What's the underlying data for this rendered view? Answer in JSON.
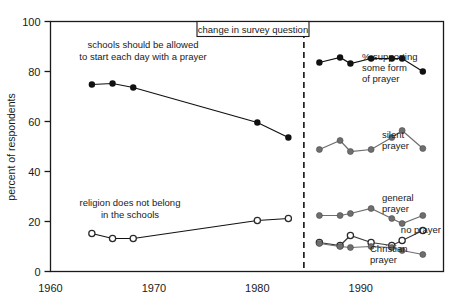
{
  "chart_data": {
    "type": "line",
    "title": "",
    "xlabel": "",
    "ylabel": "percent of respondents",
    "xlim": [
      1960,
      1998
    ],
    "ylim": [
      0,
      100
    ],
    "grid": false,
    "legend_position": "inline-right",
    "x_ticks": [
      1960,
      1970,
      1980,
      1990
    ],
    "y_ticks": [
      0,
      20,
      40,
      60,
      80,
      100
    ],
    "annotations": [
      {
        "name": "change-in-survey-question",
        "text": "change in survey question",
        "x": 1984.5,
        "boxed": true
      },
      {
        "name": "old-question-label",
        "text": "schools should be allowed\nto start each day with a prayer",
        "line1": "schools should be allowed",
        "line2": "to start each day with a prayer"
      },
      {
        "name": "religion-label",
        "text": "religion does not belong\nin the schools",
        "line1": "religion does not belong",
        "line2": "in the schools"
      }
    ],
    "vline": {
      "x": 1984.5,
      "style": "dashed",
      "label": "change in survey question"
    },
    "series": [
      {
        "name": "schools should be allowed to start each day with a prayer",
        "label": "schools should be allowed\nto start each day with a prayer",
        "marker": "filled-circle",
        "color": "#111111",
        "points": [
          [
            1964,
            74.8
          ],
          [
            1966,
            75.2
          ],
          [
            1968,
            73.6
          ],
          [
            1980,
            59.6
          ],
          [
            1983,
            53.6
          ]
        ]
      },
      {
        "name": "% supporting some form of prayer",
        "label": "% supporting\nsome form\nof prayer",
        "label_lines": [
          "% supporting",
          "some form",
          "of prayer"
        ],
        "marker": "filled-circle",
        "color": "#111111",
        "points": [
          [
            1986,
            83.6
          ],
          [
            1988,
            85.6
          ],
          [
            1989,
            83.2
          ],
          [
            1991,
            85.2
          ],
          [
            1993,
            85.2
          ],
          [
            1994,
            85.2
          ],
          [
            1996,
            80.0
          ]
        ]
      },
      {
        "name": "silent prayer",
        "label": "silent\nprayer",
        "label_lines": [
          "silent",
          "prayer"
        ],
        "marker": "grey-circle",
        "color": "#6e6e6e",
        "points": [
          [
            1986,
            48.8
          ],
          [
            1988,
            52.4
          ],
          [
            1989,
            48.0
          ],
          [
            1991,
            48.8
          ],
          [
            1993,
            53.6
          ],
          [
            1994,
            56.4
          ],
          [
            1996,
            49.2
          ]
        ]
      },
      {
        "name": "general prayer",
        "label": "general\nprayer",
        "label_lines": [
          "general",
          "prayer"
        ],
        "marker": "grey-circle",
        "color": "#6e6e6e",
        "points": [
          [
            1986,
            22.4
          ],
          [
            1988,
            22.4
          ],
          [
            1989,
            23.2
          ],
          [
            1991,
            25.2
          ],
          [
            1993,
            21.2
          ],
          [
            1994,
            19.2
          ],
          [
            1996,
            22.4
          ]
        ]
      },
      {
        "name": "no prayer",
        "label": "no prayer",
        "label_lines": [
          "no prayer"
        ],
        "marker": "open-circle",
        "color": "#3a3a3a",
        "points": [
          [
            1986,
            11.6
          ],
          [
            1988,
            10.4
          ],
          [
            1989,
            14.4
          ],
          [
            1991,
            11.6
          ],
          [
            1993,
            10.4
          ],
          [
            1994,
            12.4
          ],
          [
            1996,
            16.4
          ]
        ]
      },
      {
        "name": "Christian prayer",
        "label": "Christian\nprayer",
        "label_lines": [
          "Christian",
          "prayer"
        ],
        "marker": "grey-circle",
        "color": "#6e6e6e",
        "points": [
          [
            1986,
            11.2
          ],
          [
            1988,
            10.0
          ],
          [
            1989,
            9.6
          ],
          [
            1991,
            10.0
          ],
          [
            1993,
            9.6
          ],
          [
            1994,
            8.4
          ],
          [
            1996,
            6.8
          ]
        ]
      },
      {
        "name": "religion does not belong in the schools",
        "label": "religion does not belong\nin the schools",
        "marker": "open-circle",
        "color": "#111111",
        "points": [
          [
            1964,
            15.2
          ],
          [
            1966,
            13.2
          ],
          [
            1968,
            13.2
          ],
          [
            1980,
            20.4
          ],
          [
            1983,
            21.2
          ]
        ]
      }
    ]
  },
  "axis": {
    "y_label": "percent of respondents",
    "y_ticks": [
      "0",
      "20",
      "40",
      "60",
      "80",
      "100"
    ],
    "x_ticks": [
      "1960",
      "1970",
      "1980",
      "1990"
    ]
  },
  "labels": {
    "callout_box": "change in survey question",
    "old_question_line1": "schools should be allowed",
    "old_question_line2": "to start each day with a prayer",
    "religion_line1": "religion does not belong",
    "religion_line2": "in the schools",
    "supporting_line1": "% supporting",
    "supporting_line2": "some form",
    "supporting_line3": "of prayer",
    "silent_line1": "silent",
    "silent_line2": "prayer",
    "general_line1": "general",
    "general_line2": "prayer",
    "noprayer_line1": "no prayer",
    "christian_line1": "Christian",
    "christian_line2": "prayer"
  },
  "colors": {
    "frame": "#1a1a1a",
    "dark_marker": "#111111",
    "grey_marker": "#6e6e6e",
    "open_marker_stroke": "#2a2a2a",
    "background": "#ffffff"
  }
}
